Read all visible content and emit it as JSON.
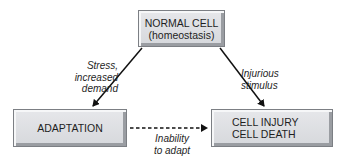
{
  "diagram": {
    "nodes": {
      "normal_cell": {
        "line1": "NORMAL CELL",
        "line2": "(homeostasis)"
      },
      "adaptation": {
        "line1": "ADAPTATION"
      },
      "cell_injury": {
        "line1": "CELL INJURY",
        "line2": "CELL DEATH"
      }
    },
    "edges": {
      "stress": {
        "line1": "Stress,",
        "line2": "increased",
        "line3": "demand",
        "from": "normal_cell",
        "to": "adaptation",
        "style": "solid"
      },
      "injurious": {
        "line1": "Injurious",
        "line2": "stimulus",
        "from": "normal_cell",
        "to": "cell_injury",
        "style": "solid"
      },
      "inability": {
        "line1": "Inability",
        "line2": "to adapt",
        "from": "adaptation",
        "to": "cell_injury",
        "style": "dashed"
      }
    },
    "colors": {
      "box_fill": "#dcdee1",
      "box_border": "#7c7f84",
      "text": "#1e1e1e",
      "arrow": "#111111"
    }
  }
}
